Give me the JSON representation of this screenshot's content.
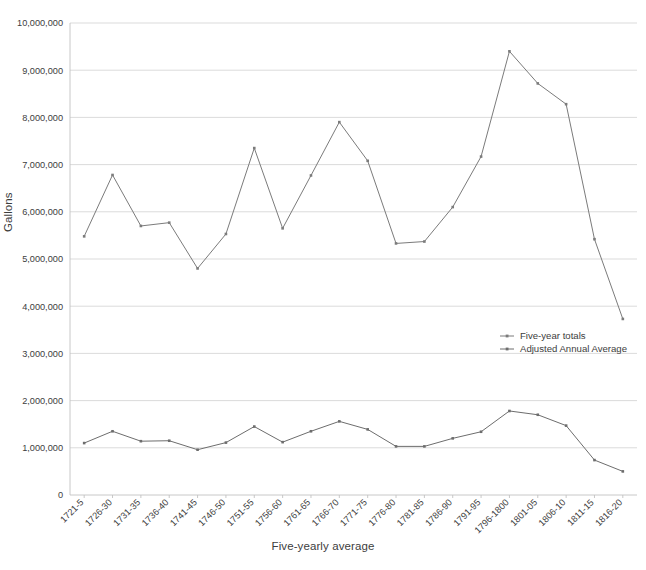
{
  "chart_data": {
    "type": "line",
    "title": "",
    "xlabel": "Five-yearly average",
    "ylabel": "Gallons",
    "ylim": [
      0,
      10000000
    ],
    "ytick_values": [
      0,
      1000000,
      2000000,
      3000000,
      4000000,
      5000000,
      6000000,
      7000000,
      8000000,
      9000000,
      10000000
    ],
    "ytick_labels": [
      "0",
      "1,000,000",
      "2,000,000",
      "3,000,000",
      "4,000,000",
      "5,000,000",
      "6,000,000",
      "7,000,000",
      "8,000,000",
      "9,000,000",
      "10,000,000"
    ],
    "grid": true,
    "legend_position": "center-right",
    "categories": [
      "1721-5",
      "1726-30",
      "1731-35",
      "1736-40",
      "1741-45",
      "1746-50",
      "1751-55",
      "1756-60",
      "1761-65",
      "1766-70",
      "1771-75",
      "1776-80",
      "1781-85",
      "1786-90",
      "1791-95",
      "1796-1800",
      "1801-05",
      "1806-10",
      "1811-15",
      "1816-20"
    ],
    "series": [
      {
        "name": "Five-year totals",
        "color": "#7b7b7b",
        "values": [
          5480000,
          6780000,
          5700000,
          5770000,
          4800000,
          5530000,
          7350000,
          5650000,
          6770000,
          7900000,
          7080000,
          5330000,
          5370000,
          6100000,
          7170000,
          9400000,
          8720000,
          8280000,
          5420000,
          3730000
        ]
      },
      {
        "name": "Adjusted Annual Average",
        "color": "#6d6d6d",
        "values": [
          1100000,
          1350000,
          1140000,
          1150000,
          960000,
          1110000,
          1450000,
          1120000,
          1350000,
          1560000,
          1390000,
          1030000,
          1030000,
          1200000,
          1340000,
          1780000,
          1700000,
          1470000,
          740000,
          500000
        ]
      }
    ]
  },
  "legend": {
    "items": [
      {
        "label": "Five-year totals"
      },
      {
        "label": "Adjusted Annual Average"
      }
    ]
  }
}
